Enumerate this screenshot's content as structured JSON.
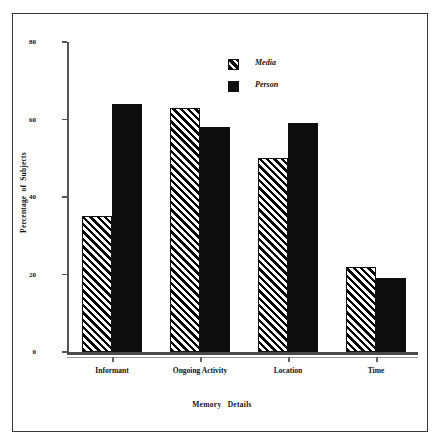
{
  "chart_data": {
    "type": "bar",
    "title": "",
    "subtitle": "",
    "xlabel": "Memory  Details",
    "ylabel": "Percentage  of  Subjects",
    "categories": [
      "Informant",
      "Ongoing Activity",
      "Location",
      "Time"
    ],
    "series": [
      {
        "name": "Media",
        "values": [
          35,
          63,
          50,
          22
        ]
      },
      {
        "name": "Person",
        "values": [
          64,
          58,
          59,
          19
        ]
      }
    ],
    "ylim": [
      0,
      80
    ],
    "yticks": [
      0,
      20,
      40,
      60,
      80
    ],
    "ytick_labels": [
      "0",
      "20",
      "40",
      "60",
      "80"
    ],
    "grid": false,
    "legend_position": "top-right",
    "legend_entries": [
      {
        "label": "Media",
        "swatch": "hatched-diagonal"
      },
      {
        "label": "Person",
        "swatch": "solid-black"
      }
    ],
    "colors": {
      "media_fill": "#ffffff",
      "media_hatch": "#000000",
      "person_fill": "#0d0d0d",
      "axis": "#4a4a4a",
      "text": "#111111",
      "frame_border": "#3a3a3a",
      "background": "#ffffff"
    }
  }
}
